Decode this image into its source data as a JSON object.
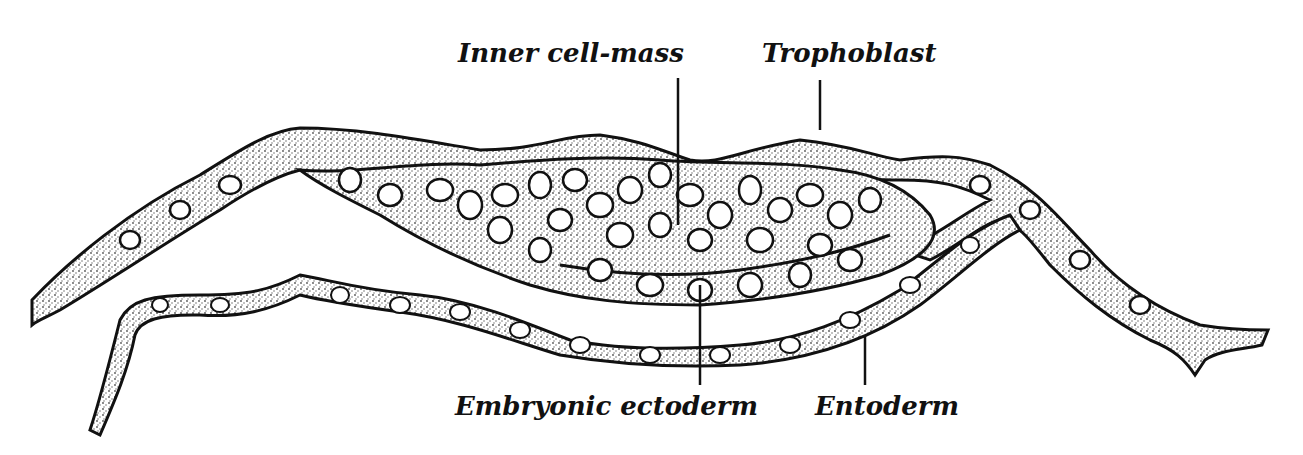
{
  "figure": {
    "labels": {
      "inner_cell_mass": "Inner cell-mass",
      "trophoblast": "Trophoblast",
      "embryonic_ectoderm": "Embryonic ectoderm",
      "entoderm": "Entoderm"
    },
    "colors": {
      "ink": "#111111",
      "stipple": "#8a8a8a",
      "background": "#ffffff"
    }
  }
}
